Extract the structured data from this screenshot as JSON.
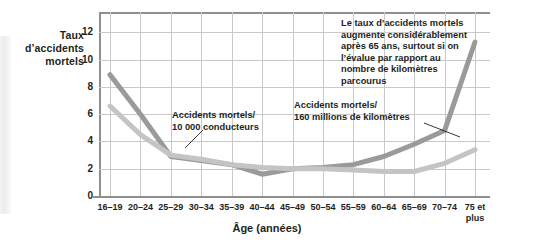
{
  "chart_data": {
    "type": "line",
    "title": "",
    "ylabel": "Taux d’accidents mortels",
    "xlabel": "Âge (années)",
    "categories": [
      "16–19",
      "20–24",
      "25–29",
      "30–34",
      "35–39",
      "40–44",
      "45–49",
      "50–54",
      "55–59",
      "60–64",
      "65–69",
      "70–74",
      "75 et\nplus"
    ],
    "ytick_labels": [
      "0",
      "2",
      "4",
      "6",
      "8",
      "10",
      "12"
    ],
    "ytick_values": [
      0,
      2,
      4,
      6,
      8,
      10,
      12
    ],
    "ylim": [
      0,
      13.5
    ],
    "grid": true,
    "legend_position": "inline-annotations",
    "series": [
      {
        "name": "Accidents mortels/ 160 millions de kilomètres",
        "color": "#9a9a9a",
        "values": [
          8.9,
          6.0,
          2.9,
          2.6,
          2.3,
          1.6,
          2.0,
          2.1,
          2.3,
          2.9,
          3.8,
          4.8,
          11.3
        ]
      },
      {
        "name": "Accidents mortels/ 10 000 conducteurs",
        "color": "#c4c4c4",
        "values": [
          6.6,
          4.5,
          3.0,
          2.7,
          2.3,
          2.1,
          2.0,
          2.0,
          1.9,
          1.8,
          1.8,
          2.4,
          3.4
        ]
      }
    ],
    "annotations": [
      {
        "id": "callout-note",
        "text": "Le taux d’accidents mortels\naugmente considérablement\naprès 65 ans, surtout si on\nl’évalue par rapport au\nnombre de kilomètres\nparcourus"
      },
      {
        "id": "label-conducteurs",
        "text": "Accidents mortels/\n10 000 conducteurs"
      },
      {
        "id": "label-kilometres",
        "text": "Accidents mortels/\n160 millions de kilomètres"
      }
    ]
  },
  "axis": {
    "y_title": "Taux\nd’accidents\nmortels",
    "x_title": "Âge (années)"
  },
  "colors": {
    "series_dark": "#9a9a9a",
    "series_light": "#c4c4c4",
    "grid": "#c9c9c9",
    "axis": "#8f8f8f",
    "text": "#231f20",
    "background": "#ffffff"
  }
}
